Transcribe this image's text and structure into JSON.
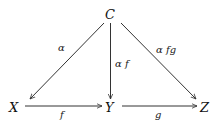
{
  "diagram": {
    "type": "commutative-diagram",
    "nodes": [
      {
        "id": "C",
        "label": "C",
        "x": 110,
        "y": 14
      },
      {
        "id": "X",
        "label": "X",
        "x": 15,
        "y": 108
      },
      {
        "id": "Y",
        "label": "Y",
        "x": 111,
        "y": 108
      },
      {
        "id": "Z",
        "label": "Z",
        "x": 206,
        "y": 108
      }
    ],
    "edges": [
      {
        "from": "C",
        "to": "X",
        "label": "α"
      },
      {
        "from": "C",
        "to": "Y",
        "label": "α f"
      },
      {
        "from": "C",
        "to": "Z",
        "label": "α fg"
      },
      {
        "from": "X",
        "to": "Y",
        "label": "f"
      },
      {
        "from": "Y",
        "to": "Z",
        "label": "g"
      }
    ]
  },
  "labels": {
    "C": "C",
    "X": "X",
    "Y": "Y",
    "Z": "Z",
    "alpha": "α",
    "alpha_f": "α f",
    "alpha_fg": "α fg",
    "f": "f",
    "g": "g"
  }
}
